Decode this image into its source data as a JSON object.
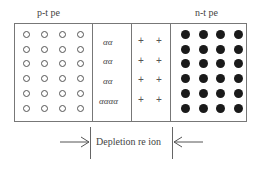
{
  "diagram": {
    "p_label": "p-t  pe",
    "n_label": "n-t  pe",
    "depletion_label": "Depletion re  ion",
    "depletion_symbols": [
      "αα",
      "αα",
      "αα",
      "αααα"
    ],
    "plus_symbol": "+",
    "p_region": {
      "rows": 6,
      "cols": 4,
      "carrier": "hole-circle"
    },
    "n_region": {
      "rows": 6,
      "cols": 4,
      "carrier": "electron-dot"
    },
    "colors": {
      "border": "#777777",
      "electron": "#1a1a1a",
      "hole": "#555555"
    }
  }
}
